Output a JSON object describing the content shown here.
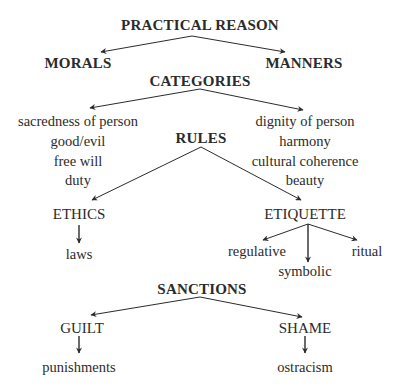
{
  "diagram": {
    "root": {
      "label": "PRACTICAL REASON",
      "x": 200,
      "y": 18
    },
    "branches": [
      {
        "label": "MORALS",
        "x": 78,
        "y": 56
      },
      {
        "label": "MANNERS",
        "x": 304,
        "y": 56
      }
    ],
    "categories": {
      "label": "CATEGORIES",
      "x": 200,
      "y": 74,
      "left": [
        {
          "label": "sacredness of person",
          "x": 78,
          "y": 114
        },
        {
          "label": "good/evil",
          "x": 78,
          "y": 134
        },
        {
          "label": "free will",
          "x": 78,
          "y": 154
        },
        {
          "label": "duty",
          "x": 78,
          "y": 173
        }
      ],
      "right": [
        {
          "label": "dignity of person",
          "x": 305,
          "y": 114
        },
        {
          "label": "harmony",
          "x": 305,
          "y": 134
        },
        {
          "label": "cultural coherence",
          "x": 305,
          "y": 154
        },
        {
          "label": "beauty",
          "x": 305,
          "y": 173
        }
      ]
    },
    "rules": {
      "label": "RULES",
      "x": 201,
      "y": 131,
      "ethics": {
        "label": "ETHICS",
        "x": 79,
        "y": 207,
        "child": {
          "label": "laws",
          "x": 79,
          "y": 247
        }
      },
      "etiquette": {
        "label": "ETIQUETTE",
        "x": 305,
        "y": 207,
        "children": [
          {
            "label": "regulative",
            "x": 257,
            "y": 244
          },
          {
            "label": "symbolic",
            "x": 305,
            "y": 264
          },
          {
            "label": "ritual",
            "x": 367,
            "y": 244
          }
        ]
      }
    },
    "sanctions": {
      "label": "SANCTIONS",
      "x": 202,
      "y": 282,
      "guilt": {
        "label": "GUILT",
        "x": 82,
        "y": 321,
        "child": {
          "label": "punishments",
          "x": 79,
          "y": 360
        }
      },
      "shame": {
        "label": "SHAME",
        "x": 305,
        "y": 321,
        "child": {
          "label": "ostracism",
          "x": 305,
          "y": 360
        }
      }
    },
    "colors": {
      "text": "#2b2b2b",
      "arrow": "#2b2b2b",
      "background": "#ffffff"
    }
  }
}
